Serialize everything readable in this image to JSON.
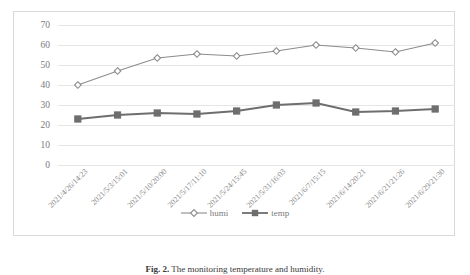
{
  "caption": {
    "prefix": "Fig. 2.",
    "text": "The monitoring temperature and humidity."
  },
  "legend": {
    "position": "bottom-center",
    "items": [
      {
        "label": "humi",
        "marker": "open-diamond-icon",
        "color": "#8c8c8c"
      },
      {
        "label": "temp",
        "marker": "filled-square-icon",
        "color": "#6e6e6e"
      }
    ]
  },
  "chart_data": {
    "type": "line",
    "title": "",
    "xlabel": "",
    "ylabel": "",
    "ylim": [
      0,
      70
    ],
    "ytick_step": 10,
    "yticks": [
      70,
      60,
      50,
      40,
      30,
      20,
      10,
      0
    ],
    "grid": "horizontal",
    "categories": [
      "2021/4/26/14:23",
      "2021/5/3/15:01",
      "2021/5/10/20:00",
      "2021/5/17/11:10",
      "2021/5/24/15:45",
      "2021/5/31/16:03",
      "2021/6/7/15:15",
      "2021/6/14/20:21",
      "2021/6/21/21:26",
      "2021/6/29/21:30"
    ],
    "series": [
      {
        "name": "humi",
        "color": "#8c8c8c",
        "marker": "open-diamond",
        "values": [
          40,
          47,
          53.5,
          55.5,
          54.5,
          57,
          60,
          58.5,
          56.5,
          61
        ]
      },
      {
        "name": "temp",
        "color": "#6e6e6e",
        "marker": "filled-square",
        "values": [
          23,
          25,
          26,
          25.5,
          27,
          30,
          31,
          26.5,
          27,
          28
        ]
      }
    ]
  },
  "colors": {
    "grid": "#e6e6e6",
    "frame": "#d9d9d9",
    "axis_text": "#7a7a7a",
    "background": "#ffffff"
  }
}
